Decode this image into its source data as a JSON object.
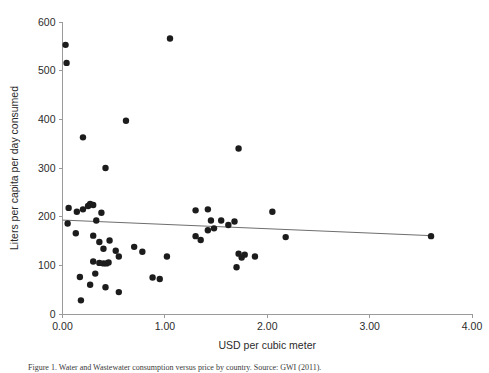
{
  "figure": {
    "caption": "Figure 1. Water and Wastewater consumption versus price by country. Source: GWI (2011)."
  },
  "chart_data": {
    "type": "scatter",
    "title": "",
    "xlabel": "USD per cubic meter",
    "ylabel": "Liters per capita per day consumed",
    "xlim": [
      0.0,
      4.0
    ],
    "ylim": [
      0,
      600
    ],
    "xticks": [
      "0.00",
      "1.00",
      "2.00",
      "3.00",
      "4.00"
    ],
    "xtick_values": [
      0.0,
      1.0,
      2.0,
      3.0,
      4.0
    ],
    "yticks": [
      "0",
      "100",
      "200",
      "300",
      "400",
      "500",
      "600"
    ],
    "ytick_values": [
      0,
      100,
      200,
      300,
      400,
      500,
      600
    ],
    "grid": false,
    "legend": null,
    "marker": "filled-circle",
    "marker_color": "#1c1c1c",
    "marker_size": 3.2,
    "points": [
      [
        0.03,
        553
      ],
      [
        0.04,
        516
      ],
      [
        0.06,
        218
      ],
      [
        0.05,
        186
      ],
      [
        0.2,
        363
      ],
      [
        0.42,
        300
      ],
      [
        0.2,
        215
      ],
      [
        0.25,
        222
      ],
      [
        0.27,
        226
      ],
      [
        0.3,
        224
      ],
      [
        0.38,
        208
      ],
      [
        0.14,
        210
      ],
      [
        0.33,
        192
      ],
      [
        0.13,
        166
      ],
      [
        0.3,
        161
      ],
      [
        0.36,
        148
      ],
      [
        0.46,
        151
      ],
      [
        0.4,
        134
      ],
      [
        0.52,
        130
      ],
      [
        0.3,
        108
      ],
      [
        0.36,
        105
      ],
      [
        0.4,
        104
      ],
      [
        0.43,
        104
      ],
      [
        0.45,
        106
      ],
      [
        0.55,
        118
      ],
      [
        0.32,
        83
      ],
      [
        0.17,
        76
      ],
      [
        0.27,
        60
      ],
      [
        0.42,
        55
      ],
      [
        0.18,
        28
      ],
      [
        0.55,
        45
      ],
      [
        0.62,
        397
      ],
      [
        0.7,
        138
      ],
      [
        0.78,
        128
      ],
      [
        0.88,
        75
      ],
      [
        0.95,
        72
      ],
      [
        1.05,
        566
      ],
      [
        1.02,
        118
      ],
      [
        1.3,
        213
      ],
      [
        1.42,
        215
      ],
      [
        1.45,
        192
      ],
      [
        1.55,
        192
      ],
      [
        1.48,
        176
      ],
      [
        1.42,
        172
      ],
      [
        1.72,
        340
      ],
      [
        1.68,
        190
      ],
      [
        1.72,
        124
      ],
      [
        1.78,
        122
      ],
      [
        1.75,
        116
      ],
      [
        1.88,
        118
      ],
      [
        1.7,
        96
      ],
      [
        1.62,
        183
      ],
      [
        1.3,
        160
      ],
      [
        1.35,
        152
      ],
      [
        2.05,
        210
      ],
      [
        2.18,
        158
      ],
      [
        3.6,
        160
      ]
    ],
    "trend_line": {
      "x_start": 0.0,
      "y_start": 193,
      "x_end": 3.6,
      "y_end": 161,
      "color": "#6e6e6e"
    }
  }
}
